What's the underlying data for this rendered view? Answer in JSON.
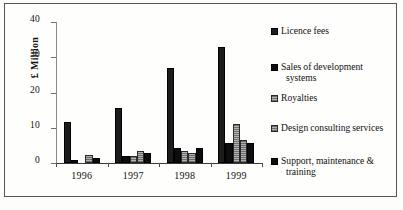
{
  "chart_data": {
    "type": "bar",
    "title": "",
    "subtitle": "",
    "xlabel": "",
    "ylabel": "£ Million",
    "categories": [
      "1996",
      "1997",
      "1998",
      "1999"
    ],
    "ylim": [
      0,
      40
    ],
    "yticks": [
      0,
      10,
      20,
      30,
      40
    ],
    "grid": false,
    "legend_position": "right",
    "series": [
      {
        "name": "Licence fees",
        "color": "#1c1c1c",
        "values": [
          11.5,
          15.5,
          27.0,
          33.0
        ]
      },
      {
        "name": "Sales of development systems",
        "color": "#0d0d0d",
        "values": [
          0.8,
          2.1,
          4.4,
          5.7
        ]
      },
      {
        "name": "Royalties",
        "color": "#8d8d8d",
        "values": [
          0.0,
          1.9,
          3.5,
          11.0
        ]
      },
      {
        "name": "Design consulting services",
        "color": "#8a8a8a",
        "values": [
          2.4,
          3.5,
          2.8,
          6.5
        ]
      },
      {
        "name": "Support, maintenance & training",
        "color": "#0d0d0d",
        "values": [
          1.3,
          2.7,
          4.2,
          5.7
        ]
      }
    ]
  },
  "axis": {
    "y_title": "£ Million",
    "y_tick_labels": [
      "40",
      "30",
      "20",
      "10",
      "0"
    ],
    "x_tick_labels": [
      "1996",
      "1997",
      "1998",
      "1999"
    ]
  },
  "legend": {
    "items": [
      {
        "label": "Licence fees",
        "label_line2": ""
      },
      {
        "label": "Sales of development",
        "label_line2": "systems"
      },
      {
        "label": "Royalties",
        "label_line2": ""
      },
      {
        "label": "Design consulting services",
        "label_line2": ""
      },
      {
        "label": "Support, maintenance &",
        "label_line2": "training"
      }
    ]
  }
}
